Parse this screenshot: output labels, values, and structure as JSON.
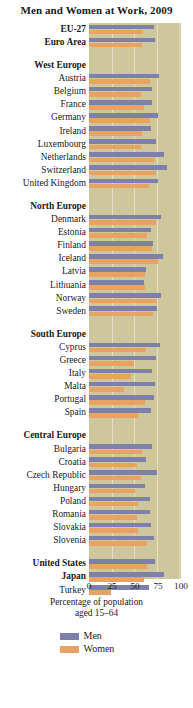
{
  "chart_data": {
    "type": "bar",
    "orientation": "horizontal",
    "title": "Men and Women at Work, 2009",
    "xlabel": "Percentage of population aged 15–64",
    "ylabel": "",
    "xlim": [
      0,
      100
    ],
    "xticks": [
      0,
      25,
      50,
      75,
      100
    ],
    "xtick_labels": [
      "0",
      "25",
      "50",
      "75",
      "100"
    ],
    "grid": true,
    "legend_position": "bottom",
    "legend": [
      "Men",
      "Women"
    ],
    "colors": {
      "men": "#7d81a9",
      "women": "#e8a263",
      "panel_background": "#cec79c",
      "page_background": "#ffffff",
      "text": "#1a1a1a"
    },
    "series": [
      {
        "name": "Men",
        "color": "#7d81a9"
      },
      {
        "name": "Women",
        "color": "#e8a263"
      }
    ],
    "categories": [
      "EU-27",
      "Euro Area",
      "Austria",
      "Belgium",
      "France",
      "Germany",
      "Ireland",
      "Luxembourg",
      "Netherlands",
      "Switzerland",
      "United Kingdom",
      "Denmark",
      "Estonia",
      "Finland",
      "Iceland",
      "Latvia",
      "Lithuania",
      "Norway",
      "Sweden",
      "Cyprus",
      "Greece",
      "Italy",
      "Malta",
      "Portugal",
      "Spain",
      "Bulgaria",
      "Croatia",
      "Czech Republic",
      "Hungary",
      "Poland",
      "Romania",
      "Slovakia",
      "Slovenia",
      "United States",
      "Japan",
      "Turkey"
    ],
    "groups": [
      {
        "heading": null,
        "items": [
          "EU-27",
          "Euro Area"
        ]
      },
      {
        "heading": "West Europe",
        "items": [
          "Austria",
          "Belgium",
          "France",
          "Germany",
          "Ireland",
          "Luxembourg",
          "Netherlands",
          "Switzerland",
          "United Kingdom"
        ]
      },
      {
        "heading": "North Europe",
        "items": [
          "Denmark",
          "Estonia",
          "Finland",
          "Iceland",
          "Latvia",
          "Lithuania",
          "Norway",
          "Sweden"
        ]
      },
      {
        "heading": "South Europe",
        "items": [
          "Cyprus",
          "Greece",
          "Italy",
          "Malta",
          "Portugal",
          "Spain"
        ]
      },
      {
        "heading": "Central Europe",
        "items": [
          "Bulgaria",
          "Croatia",
          "Czech Republic",
          "Hungary",
          "Poland",
          "Romania",
          "Slovakia",
          "Slovenia"
        ]
      },
      {
        "heading": null,
        "items": [
          "United States",
          "Japan",
          "Turkey"
        ]
      }
    ],
    "rows": [
      {
        "label": "EU-27",
        "bold": true,
        "men": 71,
        "women": 59
      },
      {
        "label": "Euro Area",
        "bold": true,
        "men": 72,
        "women": 58
      },
      {
        "label": "West Europe",
        "heading": true
      },
      {
        "label": "Austria",
        "men": 76,
        "women": 66
      },
      {
        "label": "Belgium",
        "men": 68,
        "women": 56
      },
      {
        "label": "France",
        "men": 69,
        "women": 60
      },
      {
        "label": "Germany",
        "men": 75,
        "women": 66
      },
      {
        "label": "Ireland",
        "men": 67,
        "women": 58
      },
      {
        "label": "Luxembourg",
        "men": 73,
        "women": 57
      },
      {
        "label": "Netherlands",
        "men": 82,
        "women": 71
      },
      {
        "label": "Switzerland",
        "men": 85,
        "women": 73
      },
      {
        "label": "United Kingdom",
        "men": 75,
        "women": 65
      },
      {
        "label": "North Europe",
        "heading": true
      },
      {
        "label": "Denmark",
        "men": 78,
        "women": 73
      },
      {
        "label": "Estonia",
        "men": 67,
        "women": 63
      },
      {
        "label": "Finland",
        "men": 70,
        "women": 68
      },
      {
        "label": "Iceland",
        "men": 80,
        "women": 75
      },
      {
        "label": "Latvia",
        "men": 62,
        "women": 61
      },
      {
        "label": "Lithuania",
        "men": 60,
        "women": 61
      },
      {
        "label": "Norway",
        "men": 78,
        "women": 74
      },
      {
        "label": "Sweden",
        "men": 74,
        "women": 70
      },
      {
        "label": "South Europe",
        "heading": true
      },
      {
        "label": "Cyprus",
        "men": 77,
        "women": 62
      },
      {
        "label": "Greece",
        "men": 73,
        "women": 49
      },
      {
        "label": "Italy",
        "men": 68,
        "women": 46
      },
      {
        "label": "Malta",
        "men": 72,
        "women": 38
      },
      {
        "label": "Portugal",
        "men": 71,
        "women": 61
      },
      {
        "label": "Spain",
        "men": 67,
        "women": 53
      },
      {
        "label": "Central Europe",
        "heading": true
      },
      {
        "label": "Bulgaria",
        "men": 68,
        "women": 58
      },
      {
        "label": "Croatia",
        "men": 62,
        "women": 52
      },
      {
        "label": "Czech Republic",
        "men": 74,
        "women": 57
      },
      {
        "label": "Hungary",
        "men": 61,
        "women": 50
      },
      {
        "label": "Poland",
        "men": 66,
        "women": 53
      },
      {
        "label": "Romania",
        "men": 66,
        "women": 52
      },
      {
        "label": "Slovakia",
        "men": 67,
        "women": 53
      },
      {
        "label": "Slovenia",
        "men": 71,
        "women": 63
      },
      {
        "label": "United States",
        "bold": true,
        "men": 72,
        "women": 63
      },
      {
        "label": "Japan",
        "bold": true,
        "men": 81,
        "women": 60
      },
      {
        "label": "Turkey",
        "men": 65,
        "women": 24
      }
    ]
  }
}
